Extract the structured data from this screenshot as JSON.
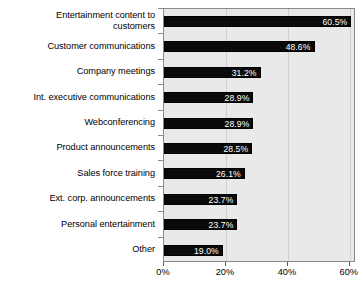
{
  "chart_data": {
    "type": "bar",
    "orientation": "horizontal",
    "title": "",
    "subtitle": "",
    "xlabel": "",
    "ylabel": "",
    "categories": [
      "Entertainment content to\ncustomers",
      "Customer communications",
      "Company meetings",
      "Int. executive communications",
      "Webconferencing",
      "Product announcements",
      "Sales force training",
      "Ext. corp. announcements",
      "Personal entertainment",
      "Other"
    ],
    "values": [
      60.5,
      48.6,
      31.2,
      28.9,
      28.9,
      28.5,
      26.1,
      23.7,
      23.7,
      19.0
    ],
    "value_labels": [
      "60.5%",
      "48.6%",
      "31.2%",
      "28.9%",
      "28.9%",
      "28.5%",
      "26.1%",
      "23.7%",
      "23.7%",
      "19.0%"
    ],
    "xlim": [
      0,
      62
    ],
    "xticks": [
      0,
      20,
      40,
      60
    ],
    "xtick_labels": [
      "0%",
      "20%",
      "40%",
      "60%"
    ],
    "grid": true,
    "legend": false,
    "colors": {
      "bar": "#0a0a0a",
      "value_label": "#ffffff",
      "plot_background": "#e9e9e9",
      "plot_border": "#8a8a8a",
      "gridline": "#cfcfcf",
      "text": "#000000",
      "page_background": "#ffffff"
    }
  }
}
